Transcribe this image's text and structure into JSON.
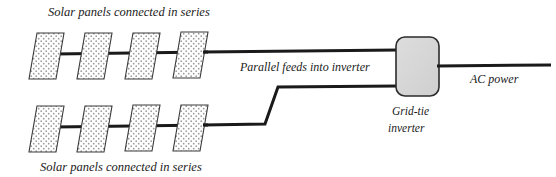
{
  "diagram": {
    "title_visible": false,
    "background_color": "#ffffff",
    "ink_color": "#1a1a1a",
    "labels": {
      "top_array": "Solar panels connected in series",
      "bottom_array": "Solar panels connected in series",
      "parallel_feed": "Parallel feeds into inverter",
      "ac_output": "AC power",
      "inverter_line1": "Grid-tie",
      "inverter_line2": "inverter"
    },
    "panel_style": {
      "fill_color": "#ffffff",
      "pattern": "dotted-speckle",
      "pattern_dot_color": "#8c8c8c",
      "stroke_color": "#333333"
    },
    "inverter": {
      "name": "grid-tie-inverter",
      "fill_color": "#d6d6d6",
      "stroke_color": "#2b2b2b",
      "shape": "rounded-rectangle"
    },
    "wire": {
      "color": "#1a1a1a",
      "width_px": 3
    },
    "top_array": {
      "name": "top-solar-array",
      "panel_count": 4,
      "panels": [
        {
          "id": "top-panel-1",
          "x": 33,
          "y": 33,
          "w": 27,
          "h": 46,
          "skew": -9
        },
        {
          "id": "top-panel-2",
          "x": 81,
          "y": 33,
          "w": 27,
          "h": 46,
          "skew": -9
        },
        {
          "id": "top-panel-3",
          "x": 129,
          "y": 33,
          "w": 27,
          "h": 46,
          "skew": -9
        },
        {
          "id": "top-panel-4",
          "x": 177,
          "y": 33,
          "w": 27,
          "h": 46,
          "skew": -9
        }
      ],
      "wire_y": 54
    },
    "bottom_array": {
      "name": "bottom-solar-array",
      "panel_count": 4,
      "panels": [
        {
          "id": "bottom-panel-1",
          "x": 33,
          "y": 106,
          "w": 27,
          "h": 46,
          "skew": -9
        },
        {
          "id": "bottom-panel-2",
          "x": 81,
          "y": 106,
          "w": 27,
          "h": 46,
          "skew": -9
        },
        {
          "id": "bottom-panel-3",
          "x": 129,
          "y": 106,
          "w": 27,
          "h": 46,
          "skew": -9
        },
        {
          "id": "bottom-panel-4",
          "x": 177,
          "y": 106,
          "w": 27,
          "h": 46,
          "skew": -9
        }
      ],
      "wire_y": 127
    }
  }
}
